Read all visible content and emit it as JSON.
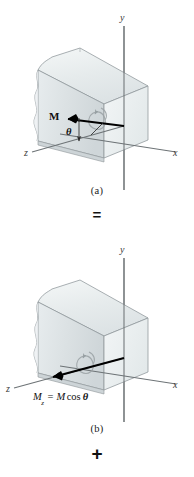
{
  "figure": {
    "background_color": "#ffffff",
    "ink_color": "#2b2b2b",
    "body_fill_top": "#e9edee",
    "body_fill_front": "#d9dfe1",
    "body_fill_right": "#eef1f2",
    "vector_color": "#000000"
  },
  "panels": [
    {
      "id": "a",
      "caption": "(a)",
      "axes": [
        {
          "name": "y-axis",
          "label": "y"
        },
        {
          "name": "x-axis",
          "label": "x"
        },
        {
          "name": "z-axis",
          "label": "z"
        }
      ],
      "vectors": [
        {
          "name": "moment-vector-M",
          "label": "M",
          "bold": true
        }
      ],
      "angles": [
        {
          "name": "angle-theta",
          "label": "θ"
        }
      ],
      "rotation_arrow": "double-headed-curl-arrow"
    },
    {
      "id": "b",
      "caption": "(b)",
      "axes": [
        {
          "name": "y-axis",
          "label": "y"
        },
        {
          "name": "x-axis",
          "label": "x"
        },
        {
          "name": "z-axis",
          "label": "z"
        }
      ],
      "vectors": [
        {
          "name": "moment-component-Mz",
          "symbol": "M",
          "subscript": "z",
          "relation": "=",
          "expression": "M cos θ",
          "full_text": "Mz = M cos θ"
        }
      ],
      "rotation_arrow": "double-headed-curl-arrow"
    }
  ],
  "operators": {
    "between_panels": "=",
    "below_panel_b": "+"
  },
  "equation_parts": {
    "m_symbol": "M",
    "z_subscript": "z",
    "equals": "=",
    "m_cos": "M",
    "cos": "cos",
    "theta": "θ"
  },
  "axis_letters": {
    "y": "y",
    "x": "x",
    "z": "z"
  },
  "labels": {
    "m_vector": "M",
    "theta": "θ"
  }
}
